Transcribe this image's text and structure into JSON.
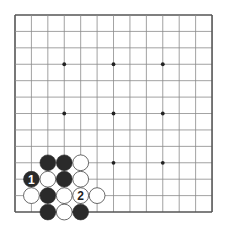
{
  "board": {
    "size": 13,
    "origin_x": 15,
    "origin_y": 15,
    "spacing": 16.42,
    "colors": {
      "background": "#ffffff",
      "line": "#8a8a8a",
      "border": "#555555",
      "star": "#222222",
      "black_stone": "#2a2a2a",
      "white_stone": "#ffffff",
      "white_stone_edge": "#444444"
    },
    "star_points": [
      {
        "col": 3,
        "row": 3
      },
      {
        "col": 6,
        "row": 3
      },
      {
        "col": 9,
        "row": 3
      },
      {
        "col": 3,
        "row": 6
      },
      {
        "col": 6,
        "row": 6
      },
      {
        "col": 9,
        "row": 6
      },
      {
        "col": 3,
        "row": 9
      },
      {
        "col": 6,
        "row": 9
      },
      {
        "col": 9,
        "row": 9
      }
    ],
    "stones": [
      {
        "col": 2,
        "row": 9,
        "color": "black",
        "label": ""
      },
      {
        "col": 3,
        "row": 9,
        "color": "black",
        "label": ""
      },
      {
        "col": 4,
        "row": 9,
        "color": "white",
        "label": ""
      },
      {
        "col": 1,
        "row": 10,
        "color": "black",
        "label": "1"
      },
      {
        "col": 2,
        "row": 10,
        "color": "white",
        "label": ""
      },
      {
        "col": 3,
        "row": 10,
        "color": "black",
        "label": ""
      },
      {
        "col": 4,
        "row": 10,
        "color": "white",
        "label": ""
      },
      {
        "col": 1,
        "row": 11,
        "color": "white",
        "label": ""
      },
      {
        "col": 2,
        "row": 11,
        "color": "black",
        "label": ""
      },
      {
        "col": 3,
        "row": 11,
        "color": "white",
        "label": ""
      },
      {
        "col": 4,
        "row": 11,
        "color": "white",
        "label": "2"
      },
      {
        "col": 5,
        "row": 11,
        "color": "white",
        "label": ""
      },
      {
        "col": 2,
        "row": 12,
        "color": "black",
        "label": ""
      },
      {
        "col": 3,
        "row": 12,
        "color": "white",
        "label": ""
      },
      {
        "col": 4,
        "row": 12,
        "color": "black",
        "label": ""
      }
    ]
  }
}
